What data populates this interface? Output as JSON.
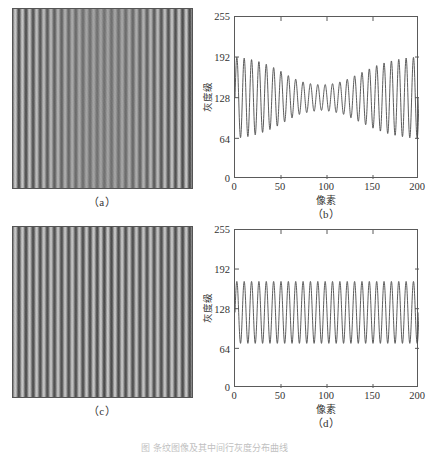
{
  "figure": {
    "caption": "图  条纹图像及其中间行灰度分布曲线",
    "panels": [
      {
        "id": "a",
        "label": "（a）",
        "type": "image"
      },
      {
        "id": "b",
        "label": "（b）",
        "type": "chart"
      },
      {
        "id": "c",
        "label": "（c）",
        "type": "image"
      },
      {
        "id": "d",
        "label": "（d）",
        "type": "chart"
      }
    ]
  },
  "images": {
    "a": {
      "name": "fringe-image-modulated",
      "description": "vertical sinusoidal fringe pattern with contrast reduced toward the centre",
      "periods": 25,
      "background": "#8a8a8a",
      "contrast_envelope": [
        1.0,
        0.92,
        0.78,
        0.6,
        0.45,
        0.38,
        0.45,
        0.62,
        0.82,
        0.96,
        1.0
      ]
    },
    "c": {
      "name": "fringe-image-uniform",
      "description": "vertical sinusoidal fringe pattern with uniform contrast",
      "periods": 25,
      "background": "#8a8a8a",
      "contrast_envelope": [
        1.0,
        1.0,
        1.0,
        1.0,
        1.0,
        1.0,
        1.0,
        1.0,
        1.0,
        1.0,
        1.0
      ]
    }
  },
  "chart_data": [
    {
      "id": "b",
      "type": "line",
      "title": "",
      "xlabel": "像素",
      "ylabel": "灰度级",
      "xlim": [
        0,
        200
      ],
      "ylim": [
        0,
        255
      ],
      "xticks": [
        0,
        50,
        100,
        150,
        200
      ],
      "yticks": [
        0,
        64,
        128,
        192,
        255
      ],
      "xticklabels": [
        "0",
        "50",
        "100",
        "150",
        "200"
      ],
      "yticklabels": [
        "0",
        "64",
        "128",
        "192",
        "255"
      ],
      "grid": false,
      "legend": null,
      "series": [
        {
          "name": "gray-level-profile",
          "color": "#4a4a4a",
          "periods": 25,
          "mean": 128,
          "amplitude_envelope": [
            64,
            62,
            58,
            52,
            44,
            34,
            26,
            22,
            20,
            22,
            26,
            34,
            42,
            50,
            56,
            60,
            63,
            64
          ],
          "ymax_observed": 192,
          "ymin_observed": 72
        }
      ]
    },
    {
      "id": "d",
      "type": "line",
      "title": "",
      "xlabel": "像素",
      "ylabel": "灰度级",
      "xlim": [
        0,
        200
      ],
      "ylim": [
        0,
        255
      ],
      "xticks": [
        0,
        50,
        100,
        150,
        200
      ],
      "yticks": [
        0,
        64,
        128,
        192,
        255
      ],
      "xticklabels": [
        "0",
        "50",
        "100",
        "150",
        "200"
      ],
      "yticklabels": [
        "0",
        "64",
        "128",
        "192",
        "255"
      ],
      "grid": false,
      "legend": null,
      "series": [
        {
          "name": "gray-level-profile",
          "color": "#4a4a4a",
          "periods": 25,
          "mean": 122,
          "amplitude_envelope": [
            50,
            50,
            50,
            50,
            50,
            50,
            50,
            50,
            50,
            50,
            50,
            50,
            50,
            50,
            50,
            50,
            50,
            50
          ],
          "ymax_observed": 172,
          "ymin_observed": 73
        }
      ]
    }
  ]
}
